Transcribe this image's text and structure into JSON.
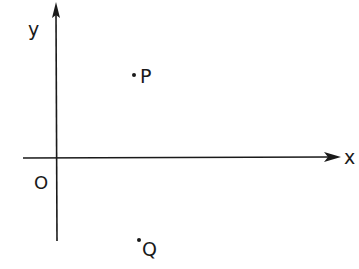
{
  "diagram": {
    "type": "coordinate-plane",
    "axes": {
      "x_label": "x",
      "y_label": "y",
      "origin_label": "O"
    },
    "points": [
      {
        "label": "P",
        "quadrant": "I"
      },
      {
        "label": "Q",
        "quadrant": "IV"
      }
    ],
    "colors": {
      "ink": "#1a1a1a",
      "background": "#ffffff"
    }
  }
}
